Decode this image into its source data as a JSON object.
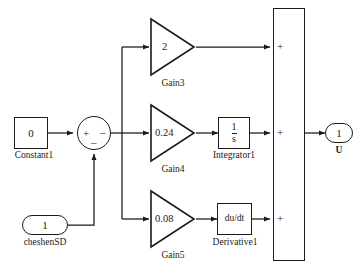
{
  "diagram": {
    "type": "simulink-block-diagram",
    "title_caption": "",
    "blocks": [
      {
        "id": "Constant1",
        "kind": "constant",
        "value": "0",
        "label": "Constant1"
      },
      {
        "id": "Sum1",
        "kind": "sum",
        "value": "",
        "label": "",
        "signs": {
          "left": "+",
          "right": "–",
          "bottom": "–"
        }
      },
      {
        "id": "cheshenSD",
        "kind": "inport",
        "value": "1",
        "label": "cheshenSD"
      },
      {
        "id": "Gain3",
        "kind": "gain",
        "value": "2",
        "label": "Gain3"
      },
      {
        "id": "Gain4",
        "kind": "gain",
        "value": "0.24",
        "label": "Gain4"
      },
      {
        "id": "Gain5",
        "kind": "gain",
        "value": "0.08",
        "label": "Gain5"
      },
      {
        "id": "Integrator1",
        "kind": "integrator",
        "value_num": "1",
        "value_den": "s",
        "label": "Integrator1"
      },
      {
        "id": "Derivative1",
        "kind": "derivative",
        "value": "du/dt",
        "label": "Derivative1"
      },
      {
        "id": "SumTall",
        "kind": "sum-tall",
        "value": "",
        "label": "",
        "signs": [
          "+",
          "+",
          "+"
        ]
      },
      {
        "id": "U",
        "kind": "outport",
        "value": "1",
        "label": "U"
      }
    ],
    "colors": {
      "line": "#1a1a1a",
      "block_fill": "#ffffff",
      "background": "#ffffff",
      "caption": "#cfcfcf"
    }
  }
}
